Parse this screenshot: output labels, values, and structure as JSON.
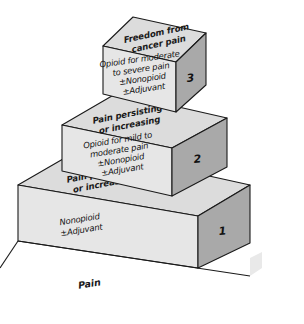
{
  "diagram": {
    "base_label": "Pain",
    "colors": {
      "top_face": "#dcdcdc",
      "front_face": "#e6e6e6",
      "side_face": "#a9a9a9",
      "outline": "#1a1a1a",
      "background": "#ffffff",
      "text": "#111111"
    }
  },
  "steps": [
    {
      "number": "1",
      "top_lines": [
        "Pain persisting",
        "or increasing"
      ],
      "front_lines": [
        "Nonopioid",
        "±Adjuvant"
      ]
    },
    {
      "number": "2",
      "top_lines": [
        "Pain persisting",
        "or increasing"
      ],
      "front_lines": [
        "Opioid for mild to",
        "moderate pain",
        "±Nonopioid",
        "±Adjuvant"
      ]
    },
    {
      "number": "3",
      "top_lines": [
        "Freedom from",
        "cancer pain"
      ],
      "front_lines": [
        "Opioid for moderate",
        "to severe pain",
        "±Nonopioid",
        "±Adjuvant"
      ]
    }
  ]
}
